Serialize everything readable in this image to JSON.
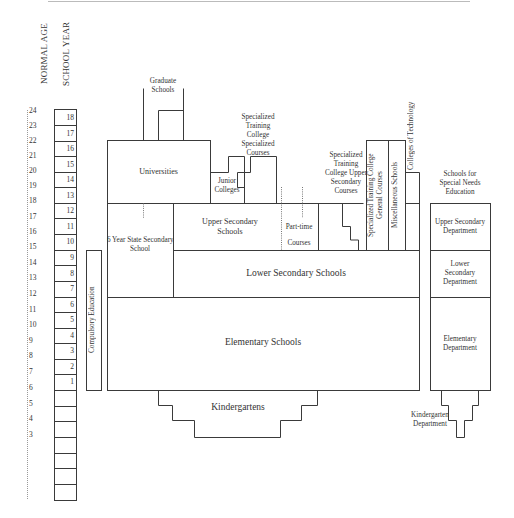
{
  "headers": {
    "normal_age": "NORMAL AGE",
    "school_year": "SCHOOL YEAR"
  },
  "ages": [
    "24",
    "23",
    "22",
    "21",
    "20",
    "19",
    "18",
    "17",
    "16",
    "15",
    "14",
    "13",
    "12",
    "11",
    "10",
    "9",
    "8",
    "7",
    "6",
    "5",
    "4",
    "3"
  ],
  "school_years": [
    "18",
    "17",
    "16",
    "15",
    "14",
    "13",
    "12",
    "11",
    "10",
    "9",
    "8",
    "7",
    "6",
    "5",
    "4",
    "3",
    "2",
    "1"
  ],
  "labels": {
    "compulsory_education": "Compulsory Education",
    "graduate_schools": [
      "Graduate",
      "Schools"
    ],
    "universities": "Universities",
    "junior_colleges": [
      "Junior",
      "Colleges"
    ],
    "specialized_training_college_specialized_courses": [
      "Specialized",
      "Training",
      "College",
      "Specialized",
      "Courses"
    ],
    "specialized_training_college_upper_secondary_courses": [
      "Specialized",
      "Training",
      "College Upper",
      "Secondary",
      "Courses"
    ],
    "specialized_training_college_general_courses": [
      "Specialized Training College",
      "General Courses"
    ],
    "miscellaneous_schools": "Miscellaneous Schools",
    "colleges_of_technology": "Colleges of Technology",
    "six_year_state_secondary_school": [
      "6 Year State Secondary",
      "School"
    ],
    "upper_secondary_schools": [
      "Upper Secondary",
      "Schools"
    ],
    "part_time_courses": [
      "Part-time",
      "Courses"
    ],
    "lower_secondary_schools": "Lower Secondary Schools",
    "elementary_schools": "Elementary Schools",
    "kindergartens": "Kindergartens",
    "schools_for_special_needs_education": [
      "Schools for",
      "Special Needs",
      "Education"
    ],
    "upper_secondary_department": [
      "Upper Secondary",
      "Department"
    ],
    "lower_secondary_department": [
      "Lower",
      "Secondary",
      "Department"
    ],
    "elementary_department": [
      "Elementary",
      "Department"
    ],
    "kindergarten_department": [
      "Kindergarten",
      "Department"
    ]
  },
  "colors": {
    "line": "#3a3a3a",
    "dotted": "#777777",
    "text": "#333333",
    "background": "#ffffff"
  }
}
